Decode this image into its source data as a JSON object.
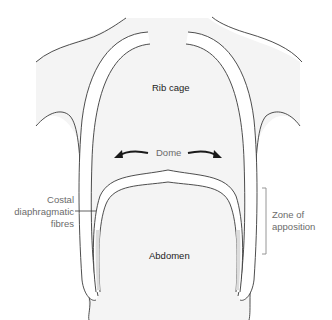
{
  "diagram": {
    "labels": {
      "rib_cage": "Rib cage",
      "dome": "Dome",
      "abdomen": "Abdomen",
      "costal_line1": "Costal",
      "costal_line2": "diaphragmatic",
      "costal_line3": "fibres",
      "zone_line1": "Zone of",
      "zone_line2": "apposition"
    },
    "colors": {
      "body_fill": "#f4f4f4",
      "outline": "#3a3a3a",
      "muscle_fill": "#e2e2e2",
      "label_dark": "#222222",
      "label_grey": "#6b6b6b",
      "arrow": "#1a1a1a"
    }
  }
}
